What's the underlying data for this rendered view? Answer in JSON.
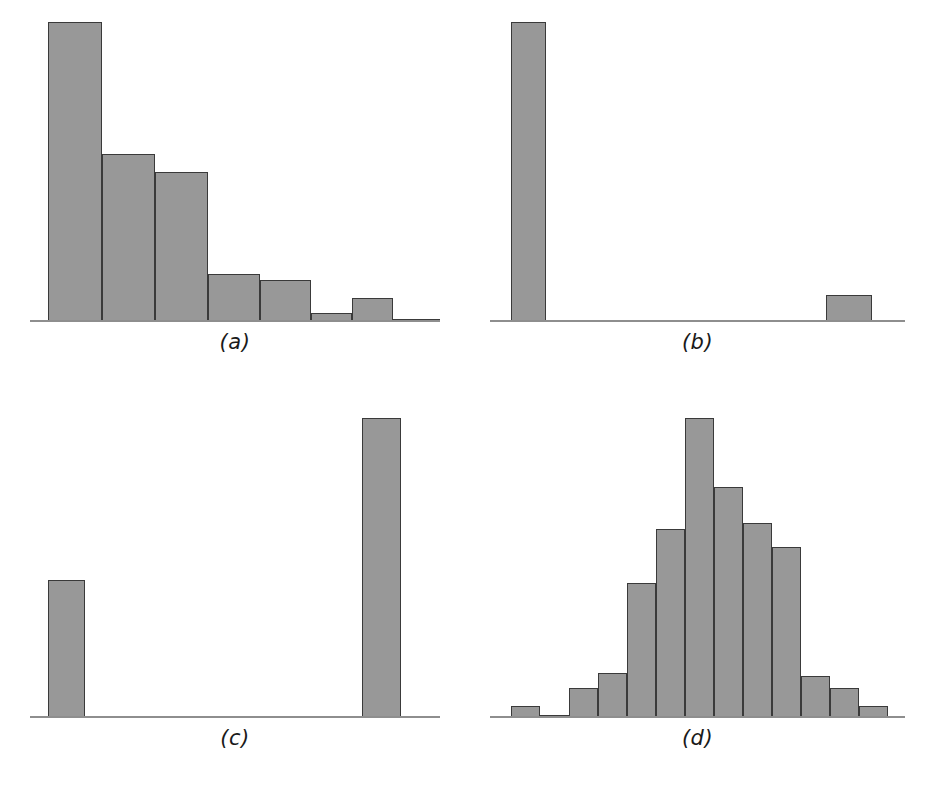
{
  "figure": {
    "background_color": "#ffffff",
    "bar_fill_color": "#989898",
    "bar_edge_color": "#3a3a3a",
    "baseline_color": "#8e8e8e",
    "layout": "2x2 grid of histogram panels"
  },
  "panels": [
    {
      "id": "a",
      "label": "(a)",
      "shape": "right-skewed"
    },
    {
      "id": "b",
      "label": "(b)",
      "shape": "extreme-bimodal"
    },
    {
      "id": "c",
      "label": "(c)",
      "shape": "u-shaped-bimodal"
    },
    {
      "id": "d",
      "label": "(d)",
      "shape": "bell-shaped"
    }
  ],
  "chart_data": [
    {
      "type": "bar",
      "id": "a",
      "title": "(a)",
      "xlabel": "",
      "ylabel": "",
      "grid": false,
      "legend": "none",
      "ylim": [
        0,
        100
      ],
      "categories": [
        "1",
        "2",
        "3",
        "4",
        "5",
        "6",
        "7",
        "8",
        "9",
        "10",
        "11",
        "12",
        "13",
        "14",
        "15"
      ],
      "values": [
        100,
        56,
        50,
        16,
        14,
        3,
        8,
        1,
        1,
        1,
        1,
        1,
        1,
        1,
        1
      ],
      "bar_left_pct": [
        4.5,
        17.5,
        30.5,
        43.5,
        56.0,
        68.5,
        78.5,
        88.5,
        91.5,
        93.5,
        95.5,
        96.5,
        97.5,
        98.5,
        99.3
      ],
      "bar_width_pct": [
        13.0,
        13.0,
        13.0,
        12.5,
        12.5,
        10.0,
        10.0,
        3.0,
        2.0,
        2.0,
        1.0,
        1.0,
        1.0,
        0.8,
        0.7
      ]
    },
    {
      "type": "bar",
      "id": "b",
      "title": "(b)",
      "xlabel": "",
      "ylabel": "",
      "grid": false,
      "legend": "none",
      "ylim": [
        0,
        100
      ],
      "categories": [
        "1",
        "2"
      ],
      "values": [
        100,
        9
      ],
      "bar_left_pct": [
        5.0,
        81.0
      ],
      "bar_width_pct": [
        8.5,
        11.0
      ]
    },
    {
      "type": "bar",
      "id": "c",
      "title": "(c)",
      "xlabel": "",
      "ylabel": "",
      "grid": false,
      "legend": "none",
      "ylim": [
        0,
        100
      ],
      "categories": [
        "1",
        "2"
      ],
      "values": [
        46,
        100
      ],
      "bar_left_pct": [
        4.5,
        81.0
      ],
      "bar_width_pct": [
        9.0,
        9.5
      ]
    },
    {
      "type": "bar",
      "id": "d",
      "title": "(d)",
      "xlabel": "",
      "ylabel": "",
      "grid": false,
      "legend": "none",
      "ylim": [
        0,
        100
      ],
      "categories": [
        "1",
        "2",
        "3",
        "4",
        "5",
        "6",
        "7",
        "8",
        "9",
        "10",
        "11",
        "12",
        "13"
      ],
      "values": [
        4,
        1,
        10,
        15,
        45,
        63,
        100,
        77,
        65,
        57,
        14,
        10,
        4
      ],
      "bar_left_pct": [
        5.0,
        12.0,
        19.0,
        26.0,
        33.0,
        40.0,
        47.0,
        54.0,
        61.0,
        68.0,
        75.0,
        82.0,
        89.0
      ],
      "bar_width_pct": [
        7.0,
        7.0,
        7.0,
        7.0,
        7.0,
        7.0,
        7.0,
        7.0,
        7.0,
        7.0,
        7.0,
        7.0,
        7.0
      ]
    }
  ]
}
